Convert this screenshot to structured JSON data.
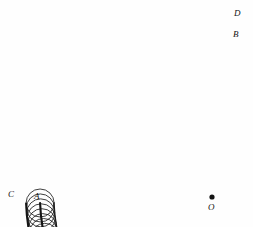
{
  "figure": {
    "background_color": "#fefefe",
    "ink_color": "#141414",
    "thin_stroke_color": "#1d1d1d",
    "labels": [
      {
        "id": "label-D",
        "text": "D",
        "x": 234,
        "y": 9,
        "role": "outer-envelope-end"
      },
      {
        "id": "label-B",
        "text": "B",
        "x": 233,
        "y": 30,
        "role": "centre-arc-end"
      },
      {
        "id": "label-C",
        "text": "C",
        "x": 8,
        "y": 190,
        "role": "outer-envelope-start"
      },
      {
        "id": "label-A",
        "text": "A",
        "x": 34,
        "y": 192,
        "role": "centre-arc-start"
      },
      {
        "id": "label-O",
        "text": "O",
        "x": 208,
        "y": 203,
        "role": "centre-of-curvature"
      }
    ],
    "centre_point": {
      "name": "O",
      "x": 212,
      "y": 197,
      "dot_radius": 2.6
    },
    "geometry": {
      "centre_of_curvature": {
        "x": 212,
        "y": 197
      },
      "centre_arc_radius": 172,
      "outer_envelope_radius": 186,
      "inner_envelope_radius": 158,
      "rolling_circle_radius": 14,
      "arc_start_angle_deg": 182,
      "arc_end_angle_deg": 253,
      "circle_count": 44
    }
  }
}
